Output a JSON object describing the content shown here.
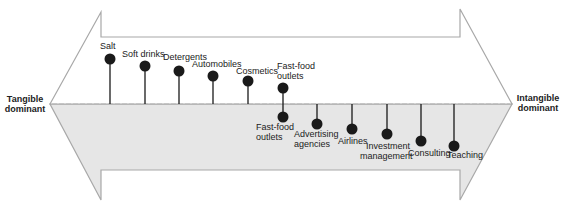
{
  "diagram": {
    "left_end": {
      "line1": "Tangible",
      "line2": "dominant"
    },
    "right_end": {
      "line1": "Intangible",
      "line2": "dominant"
    },
    "colors": {
      "arrow_top_fill": "#ffffff",
      "arrow_bottom_fill": "#e6e6e6",
      "outline": "#a8a8a8",
      "marker": "#1a1a1a",
      "stem": "#1a1a1a",
      "axis_dash": "#b0b0b0"
    },
    "tangible_items": [
      {
        "label": "Salt",
        "x": 110,
        "y": 59
      },
      {
        "label": "Soft drinks",
        "x": 145,
        "y": 66
      },
      {
        "label": "Detergents",
        "x": 179,
        "y": 71
      },
      {
        "label": "Automobiles",
        "x": 213,
        "y": 76
      },
      {
        "label": "Cosmetics",
        "x": 248,
        "y": 81
      },
      {
        "label": "Fast-food outlets",
        "x": 283,
        "y": 88
      }
    ],
    "intangible_items": [
      {
        "label": "Fast-food outlets",
        "x": 283,
        "y": 117
      },
      {
        "label": "Advertising agencies",
        "x": 317,
        "y": 124
      },
      {
        "label": "Airlines",
        "x": 352,
        "y": 129
      },
      {
        "label": "Investment management",
        "x": 387,
        "y": 134
      },
      {
        "label": "Consulting",
        "x": 421,
        "y": 141
      },
      {
        "label": "Teaching",
        "x": 454,
        "y": 146
      }
    ]
  }
}
